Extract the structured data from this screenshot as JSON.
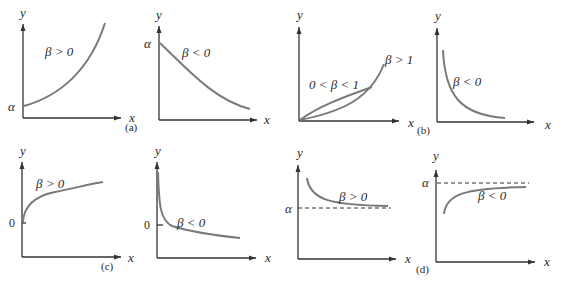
{
  "figure": {
    "panels": {
      "a": {
        "caption": "(a)",
        "left": {
          "y_axis": "y",
          "x_axis": "x",
          "intercept_label": "α",
          "curve_label": "β > 0"
        },
        "right": {
          "y_axis": "y",
          "x_axis": "x",
          "intercept_label": "α",
          "curve_label": "β < 0"
        }
      },
      "b": {
        "caption": "(b)",
        "left": {
          "y_axis": "y",
          "x_axis": "x",
          "curve_label_1": "0 < β < 1",
          "curve_label_2": "β > 1"
        },
        "right": {
          "y_axis": "y",
          "x_axis": "x",
          "curve_label": "β < 0"
        }
      },
      "c": {
        "caption": "(c)",
        "left": {
          "y_axis": "y",
          "x_axis": "x",
          "intercept_label": "0",
          "curve_label": "β > 0"
        },
        "right": {
          "y_axis": "y",
          "x_axis": "x",
          "intercept_label": "0",
          "curve_label": "β < 0"
        }
      },
      "d": {
        "caption": "(d)",
        "left": {
          "y_axis": "y",
          "x_axis": "x",
          "asymptote_label": "α",
          "curve_label": "β > 0"
        },
        "right": {
          "y_axis": "y",
          "x_axis": "x",
          "asymptote_label": "α",
          "curve_label": "β < 0"
        }
      }
    }
  }
}
